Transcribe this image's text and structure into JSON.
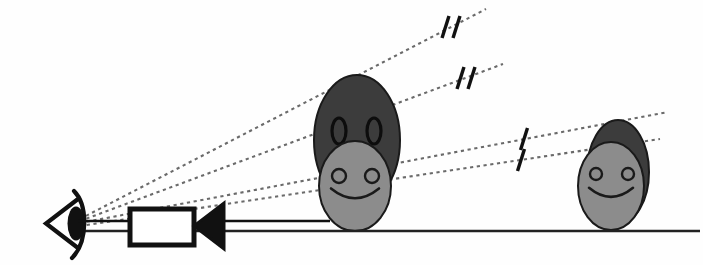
{
  "figure": {
    "background_color": "#fefefe",
    "width": 703,
    "height": 265
  },
  "colors": {
    "ink": "#111111",
    "dark_gray": "#3c3c3c",
    "light_gray": "#8c8c8c",
    "ground_line": "#222222",
    "dashed_ray": "#6a6a6a",
    "face_outline": "#1a1a1a"
  },
  "ground": {
    "label": "ground-line",
    "x1": 78,
    "y1": 231,
    "x2": 700,
    "y2": 231,
    "stroke_width": 2.4
  },
  "observer": {
    "eye": {
      "label": "eye",
      "cx": 78,
      "cy": 221,
      "apex_x": 46,
      "top_y": 199,
      "bottom_y": 248
    },
    "camera": {
      "label": "camera",
      "body_x": 130,
      "body_y": 209,
      "body_width": 64,
      "body_height": 36,
      "lens_tip_x": 194,
      "lens_back_x": 224,
      "lens_top_y": 203,
      "lens_bottom_y": 249,
      "stroke_width": 5
    }
  },
  "rays": [
    {
      "name": "ray-near-top",
      "x1": 80,
      "y1": 219,
      "x2": 486,
      "y2": 9,
      "ticks": 2,
      "tick_x": 451,
      "tick_y": 27
    },
    {
      "name": "ray-near-bottom",
      "x1": 80,
      "y1": 221,
      "x2": 503,
      "y2": 64,
      "ticks": 2,
      "tick_x": 466,
      "tick_y": 78
    },
    {
      "name": "ray-far-top",
      "x1": 80,
      "y1": 223,
      "x2": 668,
      "y2": 112,
      "ticks": 1,
      "tick_x": 524,
      "tick_y": 139
    },
    {
      "name": "ray-far-bottom",
      "x1": 80,
      "y1": 226,
      "x2": 660,
      "y2": 139,
      "ticks": 1,
      "tick_x": 521,
      "tick_y": 160
    }
  ],
  "figures": [
    {
      "name": "near-figure",
      "position": "near",
      "back_head": {
        "cx": 357,
        "cy": 140,
        "rx": 43,
        "ry": 65,
        "fill": "#3c3c3c"
      },
      "front_face": {
        "cx": 355,
        "cy": 186,
        "rx": 36,
        "ry": 45,
        "fill": "#8c8c8c"
      },
      "back_eyes": [
        {
          "cx": 339,
          "cy": 131,
          "rx": 7,
          "ry": 13
        },
        {
          "cx": 374,
          "cy": 131,
          "rx": 7,
          "ry": 13
        }
      ],
      "front_eyes": [
        {
          "cx": 339,
          "cy": 176,
          "r": 7
        },
        {
          "cx": 372,
          "cy": 176,
          "r": 7
        }
      ],
      "mouth": {
        "cx": 355,
        "cy": 193,
        "rx": 24,
        "ry": 15
      }
    },
    {
      "name": "far-figure",
      "position": "far",
      "back_head": {
        "cx": 618,
        "cy": 172,
        "rx": 31,
        "ry": 52,
        "fill": "#3c3c3c"
      },
      "front_face": {
        "cx": 611,
        "cy": 186,
        "rx": 33,
        "ry": 44,
        "fill": "#8c8c8c"
      },
      "back_eyes": [],
      "front_eyes": [
        {
          "cx": 596,
          "cy": 174,
          "r": 6
        },
        {
          "cx": 628,
          "cy": 174,
          "r": 6
        }
      ],
      "mouth": {
        "cx": 611,
        "cy": 192,
        "rx": 22,
        "ry": 14
      }
    }
  ]
}
